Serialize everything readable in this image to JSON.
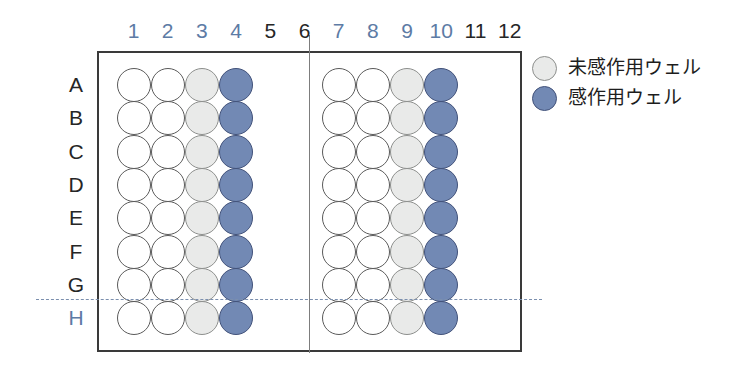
{
  "plate": {
    "column_labels": [
      {
        "text": "1",
        "color": "blue"
      },
      {
        "text": "2",
        "color": "blue"
      },
      {
        "text": "3",
        "color": "blue"
      },
      {
        "text": "4",
        "color": "blue"
      },
      {
        "text": "5",
        "color": "black"
      },
      {
        "text": "6",
        "color": "black"
      },
      {
        "text": "7",
        "color": "blue"
      },
      {
        "text": "8",
        "color": "blue"
      },
      {
        "text": "9",
        "color": "blue"
      },
      {
        "text": "10",
        "color": "blue"
      },
      {
        "text": "11",
        "color": "black"
      },
      {
        "text": "12",
        "color": "black"
      }
    ],
    "row_labels": [
      {
        "text": "A",
        "color": "black"
      },
      {
        "text": "B",
        "color": "black"
      },
      {
        "text": "C",
        "color": "black"
      },
      {
        "text": "D",
        "color": "black"
      },
      {
        "text": "E",
        "color": "black"
      },
      {
        "text": "F",
        "color": "black"
      },
      {
        "text": "G",
        "color": "black"
      },
      {
        "text": "H",
        "color": "blue"
      }
    ],
    "well_states": [
      [
        "empty",
        "empty",
        "unsensitized",
        "sensitized",
        "none",
        "none",
        "empty",
        "empty",
        "unsensitized",
        "sensitized",
        "none",
        "none"
      ],
      [
        "empty",
        "empty",
        "unsensitized",
        "sensitized",
        "none",
        "none",
        "empty",
        "empty",
        "unsensitized",
        "sensitized",
        "none",
        "none"
      ],
      [
        "empty",
        "empty",
        "unsensitized",
        "sensitized",
        "none",
        "none",
        "empty",
        "empty",
        "unsensitized",
        "sensitized",
        "none",
        "none"
      ],
      [
        "empty",
        "empty",
        "unsensitized",
        "sensitized",
        "none",
        "none",
        "empty",
        "empty",
        "unsensitized",
        "sensitized",
        "none",
        "none"
      ],
      [
        "empty",
        "empty",
        "unsensitized",
        "sensitized",
        "none",
        "none",
        "empty",
        "empty",
        "unsensitized",
        "sensitized",
        "none",
        "none"
      ],
      [
        "empty",
        "empty",
        "unsensitized",
        "sensitized",
        "none",
        "none",
        "empty",
        "empty",
        "unsensitized",
        "sensitized",
        "none",
        "none"
      ],
      [
        "empty",
        "empty",
        "unsensitized",
        "sensitized",
        "none",
        "none",
        "empty",
        "empty",
        "unsensitized",
        "sensitized",
        "none",
        "none"
      ],
      [
        "empty",
        "empty",
        "unsensitized",
        "sensitized",
        "none",
        "none",
        "empty",
        "empty",
        "unsensitized",
        "sensitized",
        "none",
        "none"
      ]
    ]
  },
  "legend": {
    "items": [
      {
        "swatch": "unsensitized",
        "label": "未感作用ウェル"
      },
      {
        "swatch": "sensitized",
        "label": "感作用ウェル"
      }
    ]
  },
  "colors": {
    "blue_label": "#5d7ba5",
    "black_label": "#262626",
    "well_sensitized": "#7289b4",
    "well_unsensitized": "#e9eae9",
    "well_empty": "#ffffff",
    "plate_border": "#3a3a3a",
    "divider": "#7d7d7d",
    "dashed_separator": "#7b8fae"
  }
}
